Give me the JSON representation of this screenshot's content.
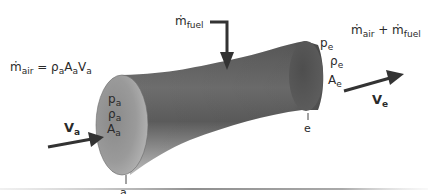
{
  "diagram": {
    "colors": {
      "tube_dark": "#4a4a4a",
      "tube_mid": "#7a7a7a",
      "tube_light": "#a8a8a8",
      "inlet_face": "#8c8c8c",
      "arrow": "#333333",
      "text": "#2a2a2a",
      "baseline": "#9a9a9a"
    },
    "inlet": {
      "station_label": "a",
      "mass_flow_equation": {
        "m": "ṁ",
        "m_sub": "air",
        "eq": " = ",
        "rho": "ρ",
        "rho_sub": "a",
        "A": "A",
        "A_sub": "a",
        "V": "V",
        "V_sub": "a"
      },
      "velocity": {
        "symbol": "V",
        "sub": "a"
      },
      "properties": [
        {
          "symbol": "p",
          "sub": "a"
        },
        {
          "symbol": "ρ",
          "sub": "a"
        },
        {
          "symbol": "A",
          "sub": "a"
        }
      ]
    },
    "fuel": {
      "m": "ṁ",
      "sub": "fuel"
    },
    "exit": {
      "station_label": "e",
      "mass_flow_sum": {
        "m1": "ṁ",
        "m1_sub": "air",
        "plus": " + ",
        "m2": "ṁ",
        "m2_sub": "fuel"
      },
      "velocity": {
        "symbol": "V",
        "sub": "e"
      },
      "properties": [
        {
          "symbol": "p",
          "sub": "e"
        },
        {
          "symbol": "ρ",
          "sub": "e"
        },
        {
          "symbol": "A",
          "sub": "e"
        }
      ]
    }
  }
}
